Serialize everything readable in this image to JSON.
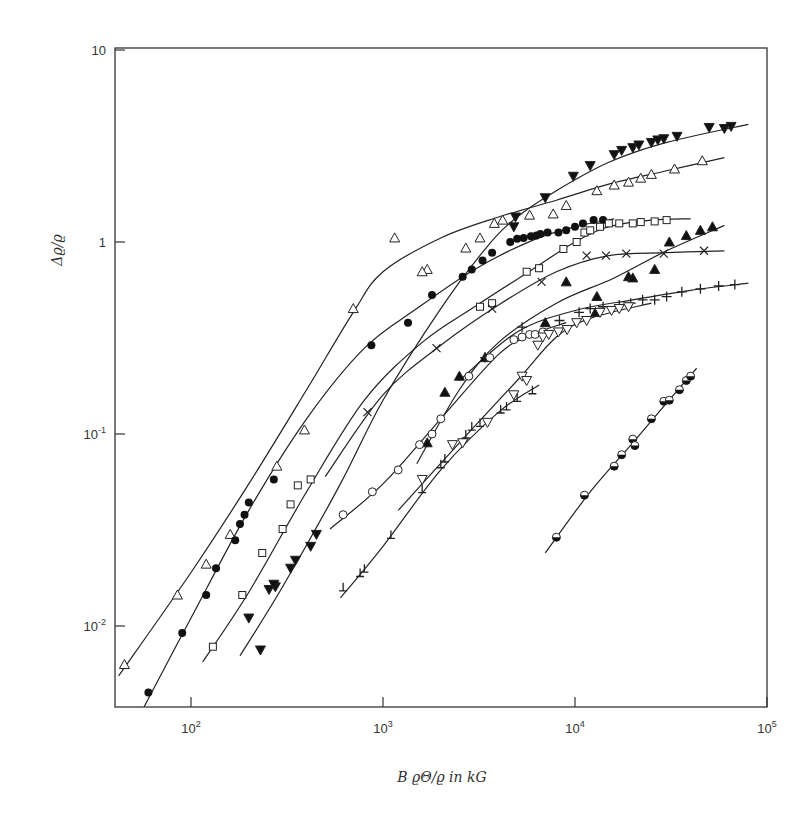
{
  "chart_data": {
    "type": "scatter",
    "title": "",
    "xlabel": "B ϱΘ/ϱ in kG",
    "ylabel": "Δϱ/ϱ",
    "xscale": "log",
    "yscale": "log",
    "xlim": [
      40,
      100000
    ],
    "ylim": [
      0.0038,
      10.2
    ],
    "grid": false,
    "legend": "none",
    "x_ticks": [
      {
        "value": 100,
        "base": "10",
        "exp": "2"
      },
      {
        "value": 1000,
        "base": "10",
        "exp": "3"
      },
      {
        "value": 10000,
        "base": "10",
        "exp": "4"
      },
      {
        "value": 100000,
        "base": "10",
        "exp": "5"
      }
    ],
    "y_ticks": [
      {
        "value": 0.01,
        "base": "10",
        "exp": "-2"
      },
      {
        "value": 0.1,
        "base": "10",
        "exp": "-1"
      },
      {
        "value": 1,
        "base": "1",
        "exp": ""
      },
      {
        "value": 10,
        "base": "10",
        "exp": ""
      }
    ],
    "series": [
      {
        "name": "open-triangle-up",
        "marker": "triangle-up-open",
        "points": [
          [
            45,
            0.0063
          ],
          [
            85,
            0.0145
          ],
          [
            120,
            0.021
          ],
          [
            160,
            0.03
          ],
          [
            280,
            0.068
          ],
          [
            390,
            0.105
          ],
          [
            700,
            0.45
          ],
          [
            1150,
            1.05
          ],
          [
            1700,
            0.72
          ],
          [
            1600,
            0.7
          ],
          [
            2700,
            0.93
          ],
          [
            3200,
            1.05
          ],
          [
            3800,
            1.25
          ],
          [
            4200,
            1.3
          ],
          [
            5800,
            1.38
          ],
          [
            7700,
            1.4
          ],
          [
            9000,
            1.55
          ],
          [
            13000,
            1.85
          ],
          [
            16000,
            1.98
          ],
          [
            19000,
            2.05
          ],
          [
            22000,
            2.15
          ],
          [
            25000,
            2.25
          ],
          [
            33000,
            2.4
          ],
          [
            46000,
            2.65
          ]
        ],
        "curve": [
          [
            42,
            0.0055
          ],
          [
            100,
            0.019
          ],
          [
            200,
            0.055
          ],
          [
            400,
            0.17
          ],
          [
            700,
            0.43
          ],
          [
            1000,
            0.7
          ],
          [
            2000,
            1.05
          ],
          [
            4000,
            1.35
          ],
          [
            8000,
            1.65
          ],
          [
            15000,
            2.0
          ],
          [
            30000,
            2.35
          ],
          [
            60000,
            2.75
          ]
        ]
      },
      {
        "name": "filled-circle",
        "marker": "circle-filled",
        "points": [
          [
            60,
            0.0045
          ],
          [
            90,
            0.0092
          ],
          [
            120,
            0.0145
          ],
          [
            135,
            0.02
          ],
          [
            170,
            0.028
          ],
          [
            180,
            0.034
          ],
          [
            190,
            0.038
          ],
          [
            200,
            0.044
          ],
          [
            270,
            0.058
          ],
          [
            870,
            0.29
          ],
          [
            1350,
            0.38
          ],
          [
            1800,
            0.53
          ],
          [
            2600,
            0.66
          ],
          [
            2900,
            0.72
          ],
          [
            3300,
            0.8
          ],
          [
            3700,
            0.88
          ],
          [
            4600,
            1.0
          ],
          [
            5000,
            1.04
          ],
          [
            5400,
            1.05
          ],
          [
            5900,
            1.07
          ],
          [
            6300,
            1.08
          ],
          [
            6600,
            1.1
          ],
          [
            7200,
            1.12
          ],
          [
            8200,
            1.12
          ],
          [
            9000,
            1.15
          ],
          [
            10000,
            1.2
          ],
          [
            11000,
            1.25
          ],
          [
            12500,
            1.3
          ],
          [
            14000,
            1.3
          ]
        ],
        "curve": [
          [
            57,
            0.0038
          ],
          [
            100,
            0.011
          ],
          [
            200,
            0.04
          ],
          [
            400,
            0.12
          ],
          [
            800,
            0.28
          ],
          [
            1500,
            0.45
          ],
          [
            3000,
            0.72
          ],
          [
            6000,
            1.02
          ],
          [
            10000,
            1.2
          ],
          [
            16000,
            1.32
          ]
        ]
      },
      {
        "name": "open-square",
        "marker": "square-open",
        "points": [
          [
            130,
            0.0078
          ],
          [
            185,
            0.0145
          ],
          [
            235,
            0.024
          ],
          [
            300,
            0.032
          ],
          [
            330,
            0.043
          ],
          [
            360,
            0.054
          ],
          [
            420,
            0.058
          ],
          [
            3200,
            0.46
          ],
          [
            3700,
            0.48
          ],
          [
            5600,
            0.7
          ],
          [
            6500,
            0.73
          ],
          [
            8700,
            0.92
          ],
          [
            10200,
            1.0
          ],
          [
            11200,
            1.12
          ],
          [
            12000,
            1.15
          ],
          [
            13500,
            1.2
          ],
          [
            15000,
            1.25
          ],
          [
            17000,
            1.25
          ],
          [
            20000,
            1.25
          ],
          [
            22000,
            1.27
          ],
          [
            26000,
            1.28
          ],
          [
            30000,
            1.3
          ]
        ],
        "curve": [
          [
            115,
            0.0065
          ],
          [
            200,
            0.015
          ],
          [
            400,
            0.05
          ],
          [
            800,
            0.15
          ],
          [
            1600,
            0.3
          ],
          [
            3000,
            0.46
          ],
          [
            6000,
            0.72
          ],
          [
            10000,
            1.0
          ],
          [
            15000,
            1.2
          ],
          [
            25000,
            1.3
          ],
          [
            40000,
            1.32
          ]
        ]
      },
      {
        "name": "filled-triangle-down",
        "marker": "triangle-down-filled",
        "points": [
          [
            230,
            0.0075
          ],
          [
            200,
            0.011
          ],
          [
            255,
            0.0155
          ],
          [
            275,
            0.016
          ],
          [
            270,
            0.0165
          ],
          [
            330,
            0.02
          ],
          [
            350,
            0.022
          ],
          [
            420,
            0.026
          ],
          [
            450,
            0.03
          ],
          [
            4900,
            1.35
          ],
          [
            4800,
            1.2
          ],
          [
            7000,
            1.7
          ],
          [
            9800,
            2.2
          ],
          [
            12000,
            2.5
          ],
          [
            16000,
            2.85
          ],
          [
            17500,
            3.0
          ],
          [
            20000,
            3.1
          ],
          [
            21500,
            3.2
          ],
          [
            25000,
            3.3
          ],
          [
            27000,
            3.4
          ],
          [
            29000,
            3.45
          ],
          [
            34000,
            3.55
          ],
          [
            50000,
            3.95
          ],
          [
            60000,
            3.9
          ],
          [
            65000,
            4.0
          ]
        ],
        "curve": [
          [
            180,
            0.007
          ],
          [
            300,
            0.016
          ],
          [
            600,
            0.055
          ],
          [
            1000,
            0.15
          ],
          [
            2000,
            0.45
          ],
          [
            3500,
            0.95
          ],
          [
            5000,
            1.35
          ],
          [
            8000,
            1.85
          ],
          [
            15000,
            2.6
          ],
          [
            30000,
            3.3
          ],
          [
            80000,
            4.1
          ]
        ]
      },
      {
        "name": "cross-x",
        "marker": "x",
        "points": [
          [
            830,
            0.13
          ],
          [
            1900,
            0.28
          ],
          [
            3700,
            0.45
          ],
          [
            6700,
            0.62
          ],
          [
            11500,
            0.85
          ],
          [
            14500,
            0.85
          ],
          [
            18500,
            0.87
          ],
          [
            29000,
            0.87
          ],
          [
            47000,
            0.9
          ]
        ],
        "curve": [
          [
            500,
            0.06
          ],
          [
            1000,
            0.16
          ],
          [
            2000,
            0.29
          ],
          [
            4000,
            0.47
          ],
          [
            8000,
            0.7
          ],
          [
            15000,
            0.85
          ],
          [
            30000,
            0.88
          ],
          [
            60000,
            0.9
          ]
        ]
      },
      {
        "name": "filled-triangle-up",
        "marker": "triangle-up-filled",
        "points": [
          [
            1700,
            0.09
          ],
          [
            2100,
            0.165
          ],
          [
            2500,
            0.2
          ],
          [
            3400,
            0.25
          ],
          [
            7000,
            0.38
          ],
          [
            9000,
            0.62
          ],
          [
            13000,
            0.52
          ],
          [
            12800,
            0.43
          ],
          [
            19000,
            0.66
          ],
          [
            20000,
            0.65
          ],
          [
            26000,
            0.72
          ],
          [
            31000,
            1.0
          ],
          [
            38000,
            1.08
          ],
          [
            45000,
            1.15
          ],
          [
            52000,
            1.2
          ]
        ],
        "curve": [
          [
            1500,
            0.07
          ],
          [
            2500,
            0.17
          ],
          [
            4000,
            0.3
          ],
          [
            8000,
            0.48
          ],
          [
            16000,
            0.65
          ],
          [
            30000,
            0.9
          ],
          [
            60000,
            1.22
          ]
        ]
      },
      {
        "name": "plus",
        "marker": "plus",
        "points": [
          [
            3400,
            0.25
          ],
          [
            5300,
            0.36
          ],
          [
            8300,
            0.39
          ],
          [
            10500,
            0.43
          ],
          [
            12000,
            0.45
          ],
          [
            14000,
            0.46
          ],
          [
            17000,
            0.47
          ],
          [
            19500,
            0.48
          ],
          [
            22500,
            0.5
          ],
          [
            26000,
            0.5
          ],
          [
            30000,
            0.52
          ],
          [
            36000,
            0.55
          ],
          [
            45000,
            0.57
          ],
          [
            56000,
            0.59
          ],
          [
            68000,
            0.6
          ]
        ],
        "curve": [
          [
            2500,
            0.19
          ],
          [
            5000,
            0.34
          ],
          [
            10000,
            0.44
          ],
          [
            20000,
            0.5
          ],
          [
            40000,
            0.56
          ],
          [
            80000,
            0.61
          ]
        ]
      },
      {
        "name": "open-circle",
        "marker": "circle-open",
        "points": [
          [
            620,
            0.038
          ],
          [
            880,
            0.05
          ],
          [
            1200,
            0.065
          ],
          [
            1550,
            0.088
          ],
          [
            1800,
            0.1
          ],
          [
            2000,
            0.12
          ],
          [
            2800,
            0.2
          ],
          [
            3600,
            0.25
          ],
          [
            4800,
            0.31
          ],
          [
            5300,
            0.32
          ],
          [
            5800,
            0.33
          ],
          [
            6200,
            0.33
          ],
          [
            6800,
            0.34
          ]
        ],
        "curve": [
          [
            530,
            0.032
          ],
          [
            1000,
            0.055
          ],
          [
            2000,
            0.12
          ],
          [
            4000,
            0.26
          ],
          [
            6000,
            0.33
          ],
          [
            9000,
            0.38
          ]
        ]
      },
      {
        "name": "open-triangle-down",
        "marker": "triangle-down-open",
        "points": [
          [
            1600,
            0.058
          ],
          [
            2300,
            0.088
          ],
          [
            2600,
            0.09
          ],
          [
            3500,
            0.115
          ],
          [
            4800,
            0.16
          ],
          [
            5300,
            0.2
          ],
          [
            5600,
            0.19
          ],
          [
            6400,
            0.29
          ],
          [
            6800,
            0.32
          ],
          [
            7300,
            0.33
          ],
          [
            8200,
            0.34
          ],
          [
            9100,
            0.35
          ],
          [
            10200,
            0.38
          ],
          [
            11500,
            0.39
          ],
          [
            13500,
            0.43
          ],
          [
            15500,
            0.44
          ],
          [
            17000,
            0.45
          ],
          [
            19000,
            0.46
          ]
        ],
        "curve": [
          [
            1200,
            0.04
          ],
          [
            2500,
            0.09
          ],
          [
            5000,
            0.19
          ],
          [
            8000,
            0.32
          ],
          [
            12000,
            0.4
          ],
          [
            25000,
            0.48
          ]
        ]
      },
      {
        "name": "tee-marker",
        "marker": "tee",
        "points": [
          [
            620,
            0.016
          ],
          [
            760,
            0.019
          ],
          [
            800,
            0.02
          ],
          [
            1100,
            0.03
          ],
          [
            1600,
            0.052
          ],
          [
            2000,
            0.07
          ],
          [
            2100,
            0.075
          ],
          [
            2700,
            0.1
          ],
          [
            2900,
            0.11
          ],
          [
            3200,
            0.115
          ],
          [
            4100,
            0.135
          ],
          [
            4400,
            0.14
          ],
          [
            5000,
            0.155
          ],
          [
            6000,
            0.17
          ]
        ],
        "curve": [
          [
            600,
            0.014
          ],
          [
            1000,
            0.026
          ],
          [
            2000,
            0.065
          ],
          [
            4000,
            0.13
          ],
          [
            6500,
            0.18
          ]
        ]
      },
      {
        "name": "half-filled-circle",
        "marker": "circle-half",
        "points": [
          [
            8000,
            0.029
          ],
          [
            11200,
            0.048
          ],
          [
            16000,
            0.068
          ],
          [
            17500,
            0.078
          ],
          [
            20000,
            0.094
          ],
          [
            20500,
            0.087
          ],
          [
            25000,
            0.12
          ],
          [
            29000,
            0.148
          ],
          [
            31000,
            0.15
          ],
          [
            35000,
            0.17
          ],
          [
            38000,
            0.19
          ],
          [
            40000,
            0.2
          ]
        ],
        "curve": [
          [
            7000,
            0.024
          ],
          [
            12000,
            0.05
          ],
          [
            20000,
            0.09
          ],
          [
            30000,
            0.145
          ],
          [
            43000,
            0.22
          ]
        ]
      }
    ]
  }
}
